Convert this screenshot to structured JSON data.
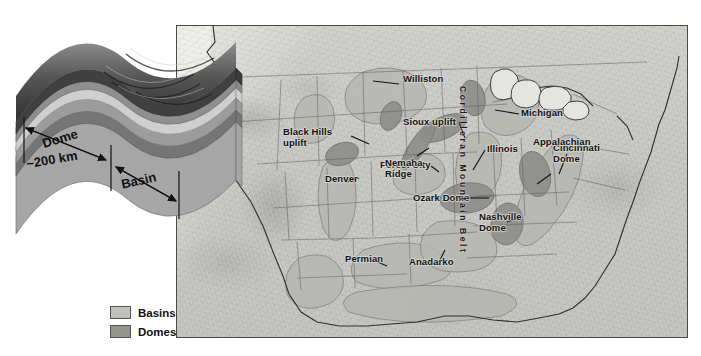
{
  "figure": {
    "kind": "geologic-map-with-block-diagram",
    "background_color": "#ffffff"
  },
  "block_diagram": {
    "name": "dome-and-basin-block-diagram",
    "scale_labels": {
      "dome": "Dome",
      "distance": "~200 km",
      "basin": "Basin"
    },
    "layer_colors": [
      "#3a3a3a",
      "#6f6f6f",
      "#9d9d9d",
      "#cfcfcf",
      "#8a8a8a",
      "#707070",
      "#a6a6a6"
    ]
  },
  "legend": {
    "title": "",
    "items": [
      {
        "label": "Basins",
        "color": "#c0c0bc"
      },
      {
        "label": "Domes",
        "color": "#94948f"
      }
    ]
  },
  "map": {
    "frame_color": "#4a4a4a",
    "relief_base_color": "#c6c6c2",
    "ocean_color": "#ededea",
    "belts": [
      {
        "label": "Cordilleran Mountain Belt",
        "orientation": "vertical"
      },
      {
        "label": "Appalachian Fold Belt",
        "orientation": "diagonal"
      }
    ],
    "labels": [
      {
        "text": "Williston",
        "kind": "basin"
      },
      {
        "text": "Black Hills\nuplift",
        "kind": "dome"
      },
      {
        "text": "Sioux uplift",
        "kind": "dome"
      },
      {
        "text": "Michigan",
        "kind": "basin"
      },
      {
        "text": "Forest City",
        "kind": "basin"
      },
      {
        "text": "Illinois",
        "kind": "basin"
      },
      {
        "text": "Cincinnati\nDome",
        "kind": "dome"
      },
      {
        "text": "Appalachian",
        "kind": "basin"
      },
      {
        "text": "Nemaha\nRidge",
        "kind": "dome"
      },
      {
        "text": "Denver",
        "kind": "basin"
      },
      {
        "text": "Ozark Dome",
        "kind": "dome"
      },
      {
        "text": "Nashville\nDome",
        "kind": "dome"
      },
      {
        "text": "Permian",
        "kind": "basin"
      },
      {
        "text": "Anadarko",
        "kind": "basin"
      }
    ]
  }
}
